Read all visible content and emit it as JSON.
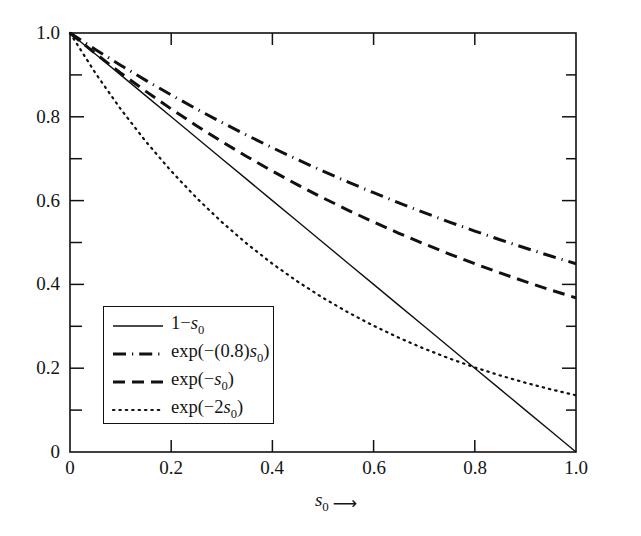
{
  "chart_data": {
    "type": "line",
    "title": "",
    "xlabel": "s_0",
    "ylabel": "",
    "xlim": [
      0,
      1
    ],
    "ylim": [
      0,
      1
    ],
    "grid": false,
    "legend_position": "lower-left-inside",
    "x_tick_labels": [
      "0",
      "0.2",
      "0.4",
      "0.6",
      "0.8",
      "1.0"
    ],
    "x_tick_values": [
      0,
      0.2,
      0.4,
      0.6,
      0.8,
      1.0
    ],
    "y_tick_labels": [
      "0",
      "0.2",
      "0.4",
      "0.6",
      "0.8",
      "1.0"
    ],
    "y_tick_values": [
      0,
      0.2,
      0.4,
      0.6,
      0.8,
      1.0
    ],
    "y_minor_tick_values": [
      0.1,
      0.3,
      0.5,
      0.7,
      0.9
    ],
    "x": [
      0,
      0.05,
      0.1,
      0.15,
      0.2,
      0.25,
      0.3,
      0.35,
      0.4,
      0.45,
      0.5,
      0.55,
      0.6,
      0.65,
      0.7,
      0.75,
      0.8,
      0.85,
      0.9,
      0.95,
      1.0
    ],
    "series": [
      {
        "name": "1-s_0",
        "label": "1−s₀",
        "style": "solid",
        "color": "#111111",
        "width": 1.4,
        "values": [
          1.0,
          0.95,
          0.9,
          0.85,
          0.8,
          0.75,
          0.7,
          0.65,
          0.6,
          0.55,
          0.5,
          0.45,
          0.4,
          0.35,
          0.3,
          0.25,
          0.2,
          0.15,
          0.1,
          0.05,
          0.0
        ]
      },
      {
        "name": "exp(-(0.8)s_0)",
        "label": "exp(−(0.8)s₀)",
        "style": "dashdot",
        "color": "#111111",
        "width": 3.0,
        "values": [
          1.0,
          0.9608,
          0.9231,
          0.8869,
          0.8521,
          0.8187,
          0.7866,
          0.7558,
          0.7261,
          0.6977,
          0.6703,
          0.644,
          0.6188,
          0.5945,
          0.5712,
          0.5488,
          0.5273,
          0.5066,
          0.4868,
          0.4677,
          0.4493
        ]
      },
      {
        "name": "exp(-s_0)",
        "label": "exp(−s₀)",
        "style": "dashed",
        "color": "#111111",
        "width": 3.0,
        "values": [
          1.0,
          0.9512,
          0.9048,
          0.8607,
          0.8187,
          0.7788,
          0.7408,
          0.7047,
          0.6703,
          0.6376,
          0.6065,
          0.5769,
          0.5488,
          0.522,
          0.4966,
          0.4724,
          0.4493,
          0.4274,
          0.4066,
          0.3867,
          0.3679
        ]
      },
      {
        "name": "exp(-2s_0)",
        "label": "exp(−2s₀)",
        "style": "dotted",
        "color": "#111111",
        "width": 2.2,
        "values": [
          1.0,
          0.9048,
          0.8187,
          0.7408,
          0.6703,
          0.6065,
          0.5488,
          0.4966,
          0.4493,
          0.4066,
          0.3679,
          0.3329,
          0.3012,
          0.2725,
          0.2466,
          0.2231,
          0.2019,
          0.1827,
          0.1653,
          0.1496,
          0.1353
        ]
      }
    ]
  },
  "axis": {
    "x_title_variable": "s",
    "x_title_subscript": "0",
    "x_title_arrow": "⟶"
  },
  "legend": {
    "entries": [
      {
        "label": "1−s₀",
        "prefix": "1−",
        "variable": "s",
        "subscript": "0",
        "suffix": "",
        "style": "solid"
      },
      {
        "label": "exp(−(0.8)s₀)",
        "prefix": "exp(−(0.8)",
        "variable": "s",
        "subscript": "0",
        "suffix": ")",
        "style": "dashdot"
      },
      {
        "label": "exp(−s₀)",
        "prefix": "exp(−",
        "variable": "s",
        "subscript": "0",
        "suffix": ")",
        "style": "dashed"
      },
      {
        "label": "exp(−2s₀)",
        "prefix": "exp(−2",
        "variable": "s",
        "subscript": "0",
        "suffix": ")",
        "style": "dotted"
      }
    ]
  },
  "colors": {
    "ink": "#111111",
    "background": "#ffffff"
  }
}
